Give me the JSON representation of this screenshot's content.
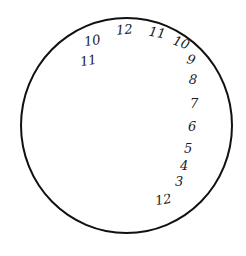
{
  "drawing": {
    "title": "Hand-drawn clock face",
    "stroke_color": "#111111",
    "background": "#ffffff",
    "numbers": [
      {
        "label": "10",
        "x": 84,
        "y": 34,
        "rot": -10
      },
      {
        "label": "11",
        "x": 80,
        "y": 54,
        "rot": -10
      },
      {
        "label": "12",
        "x": 116,
        "y": 23,
        "rot": -5
      },
      {
        "label": "11",
        "x": 149,
        "y": 26,
        "rot": 10
      },
      {
        "label": "10",
        "x": 173,
        "y": 36,
        "rot": 20
      },
      {
        "label": "9",
        "x": 187,
        "y": 53,
        "rot": 15
      },
      {
        "label": "8",
        "x": 189,
        "y": 73,
        "rot": 5
      },
      {
        "label": "7",
        "x": 190,
        "y": 97,
        "rot": 0
      },
      {
        "label": "6",
        "x": 188,
        "y": 120,
        "rot": 0
      },
      {
        "label": "5",
        "x": 184,
        "y": 142,
        "rot": 0
      },
      {
        "label": "4",
        "x": 180,
        "y": 159,
        "rot": 0
      },
      {
        "label": "3",
        "x": 175,
        "y": 175,
        "rot": 0
      },
      {
        "label": "12",
        "x": 155,
        "y": 193,
        "rot": -10
      }
    ]
  }
}
